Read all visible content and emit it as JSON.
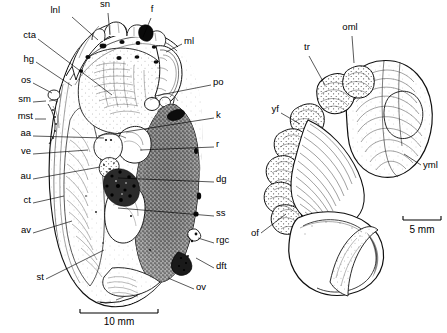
{
  "figure": {
    "type": "scientific-anatomical-illustration",
    "panels": [
      {
        "id": "left-panel",
        "name": "whole-animal-sagittal-view",
        "scale_bar": {
          "label": "10 mm",
          "x1": 80,
          "x2": 158,
          "y": 313,
          "text_x": 119,
          "text_y": 325
        },
        "labels": [
          {
            "key": "lnl",
            "text": "lnl",
            "x": 60,
            "y": 13,
            "anchor": "end",
            "leader": [
              [
                72,
                17
              ],
              [
                98,
                40
              ]
            ]
          },
          {
            "key": "sn",
            "text": "sn",
            "x": 105,
            "y": 7,
            "anchor": "middle",
            "leader": [
              [
                108,
                13
              ],
              [
                110,
                35
              ]
            ]
          },
          {
            "key": "f",
            "text": "f",
            "x": 152,
            "y": 12,
            "anchor": "middle",
            "leader": [
              [
                151,
                18
              ],
              [
                143,
                37
              ]
            ]
          },
          {
            "key": "ml",
            "text": "ml",
            "x": 184,
            "y": 44,
            "anchor": "start",
            "leader": [
              [
                182,
                44
              ],
              [
                166,
                52
              ]
            ]
          },
          {
            "key": "cta",
            "text": "cta",
            "x": 36,
            "y": 38,
            "anchor": "end",
            "leader": [
              [
                38,
                39
              ],
              [
                112,
                95
              ]
            ]
          },
          {
            "key": "hg",
            "text": "hg",
            "x": 34,
            "y": 62,
            "anchor": "end",
            "leader": [
              [
                36,
                62
              ],
              [
                72,
                86
              ]
            ]
          },
          {
            "key": "os",
            "text": "os",
            "x": 31,
            "y": 83,
            "anchor": "end",
            "leader": [
              [
                33,
                83
              ],
              [
                52,
                93
              ]
            ]
          },
          {
            "key": "sm",
            "text": "sm",
            "x": 31,
            "y": 102,
            "anchor": "end",
            "leader": [
              [
                33,
                102
              ],
              [
                46,
                101
              ]
            ]
          },
          {
            "key": "mst",
            "text": "mst",
            "x": 33,
            "y": 119,
            "anchor": "end",
            "leader": [
              [
                35,
                119
              ],
              [
                46,
                119
              ]
            ]
          },
          {
            "key": "aa",
            "text": "aa",
            "x": 31,
            "y": 136,
            "anchor": "end",
            "leader": [
              [
                33,
                136
              ],
              [
                104,
                138
              ]
            ]
          },
          {
            "key": "ve",
            "text": "ve",
            "x": 31,
            "y": 154,
            "anchor": "end",
            "leader": [
              [
                33,
                154
              ],
              [
                88,
                150
              ]
            ]
          },
          {
            "key": "au",
            "text": "au",
            "x": 31,
            "y": 179,
            "anchor": "end",
            "leader": [
              [
                33,
                179
              ],
              [
                100,
                167
              ]
            ]
          },
          {
            "key": "ct",
            "text": "ct",
            "x": 31,
            "y": 203,
            "anchor": "end",
            "leader": [
              [
                33,
                203
              ],
              [
                64,
                196
              ]
            ]
          },
          {
            "key": "av",
            "text": "av",
            "x": 31,
            "y": 233,
            "anchor": "end",
            "leader": [
              [
                33,
                233
              ],
              [
                72,
                221
              ]
            ]
          },
          {
            "key": "st",
            "text": "st",
            "x": 44,
            "y": 280,
            "anchor": "end",
            "leader": [
              [
                46,
                279
              ],
              [
                104,
                250
              ]
            ]
          },
          {
            "key": "po",
            "text": "po",
            "x": 213,
            "y": 85,
            "anchor": "start",
            "leader": [
              [
                211,
                85
              ],
              [
                155,
                96
              ]
            ]
          },
          {
            "key": "k",
            "text": "k",
            "x": 216,
            "y": 118,
            "anchor": "start",
            "leader": [
              [
                214,
                118
              ],
              [
                118,
                133
              ]
            ]
          },
          {
            "key": "r",
            "text": "r",
            "x": 216,
            "y": 147,
            "anchor": "start",
            "leader": [
              [
                214,
                147
              ],
              [
                140,
                150
              ]
            ]
          },
          {
            "key": "dg",
            "text": "dg",
            "x": 216,
            "y": 182,
            "anchor": "start",
            "leader": [
              [
                214,
                182
              ],
              [
                118,
                178
              ]
            ]
          },
          {
            "key": "ss",
            "text": "ss",
            "x": 216,
            "y": 216,
            "anchor": "start",
            "leader": [
              [
                214,
                216
              ],
              [
                118,
                208
              ]
            ]
          },
          {
            "key": "rgc",
            "text": "rgc",
            "x": 216,
            "y": 243,
            "anchor": "start",
            "leader": [
              [
                214,
                243
              ],
              [
                198,
                238
              ]
            ]
          },
          {
            "key": "dft",
            "text": "dft",
            "x": 216,
            "y": 269,
            "anchor": "start",
            "leader": [
              [
                214,
                268
              ],
              [
                196,
                258
              ]
            ]
          },
          {
            "key": "ov",
            "text": "ov",
            "x": 196,
            "y": 290,
            "anchor": "start",
            "leader": [
              [
                194,
                289
              ],
              [
                168,
                278
              ]
            ]
          }
        ]
      },
      {
        "id": "right-panel",
        "name": "gill-visceral-mass-detail",
        "scale_bar": {
          "label": "5 mm",
          "x1": 403,
          "x2": 441,
          "y": 220,
          "text_x": 422,
          "text_y": 233
        },
        "labels": [
          {
            "key": "oml",
            "text": "oml",
            "x": 350,
            "y": 30,
            "anchor": "middle",
            "leader": [
              [
                352,
                36
              ],
              [
                354,
                63
              ]
            ]
          },
          {
            "key": "tr",
            "text": "tr",
            "x": 307,
            "y": 50,
            "anchor": "middle",
            "leader": [
              [
                309,
                56
              ],
              [
                325,
                85
              ]
            ]
          },
          {
            "key": "yf",
            "text": "yf",
            "x": 279,
            "y": 112,
            "anchor": "end",
            "leader": [
              [
                281,
                113
              ],
              [
                300,
                124
              ]
            ]
          },
          {
            "key": "yml",
            "text": "yml",
            "x": 423,
            "y": 168,
            "anchor": "start",
            "leader": [
              [
                421,
                165
              ],
              [
                404,
                154
              ]
            ]
          },
          {
            "key": "of",
            "text": "of",
            "x": 259,
            "y": 236,
            "anchor": "end",
            "leader": [
              [
                261,
                233
              ],
              [
                286,
                214
              ]
            ]
          }
        ]
      }
    ]
  }
}
